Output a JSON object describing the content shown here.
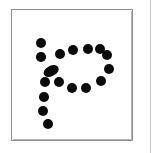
{
  "canvas": {
    "width": 154,
    "height": 153,
    "background_color": "#ffffff"
  },
  "frame": {
    "label": "stimulus-card",
    "x": 11,
    "y": 9,
    "width": 122,
    "height": 132,
    "border_color": "#8f8f8f",
    "border_width": 1,
    "fill_color": "#ffffff"
  },
  "outer_panel_edge": {
    "label": "panel-edge-right",
    "x": 150,
    "color": "#c9c9c9"
  },
  "glyph": {
    "label": "dotted-letter-p",
    "description": "Lowercase letter p drawn as a sequence of discrete filled black dots",
    "character": "p",
    "dot_color": "#0a0a0a",
    "dot_count": 19,
    "stroke_parts": [
      "bowl",
      "stem"
    ]
  },
  "chart_data": {
    "type": "scatter",
    "xlabel": "",
    "ylabel": "",
    "xlim": [
      11,
      133
    ],
    "ylim": [
      9,
      141
    ],
    "grid": false,
    "legend": null,
    "marker": "circle",
    "marker_color": "#0a0a0a",
    "series": [
      {
        "name": "bowl",
        "points": [
          {
            "x": 40,
            "y": 42,
            "r": 5.0
          },
          {
            "x": 40,
            "y": 56,
            "r": 4.8
          },
          {
            "x": 50,
            "y": 70,
            "r": 5.6,
            "elongated": true,
            "angle": 62
          },
          {
            "x": 44,
            "y": 81,
            "r": 5.0
          },
          {
            "x": 58,
            "y": 81,
            "r": 5.0
          },
          {
            "x": 59,
            "y": 53,
            "r": 5.0
          },
          {
            "x": 72,
            "y": 49,
            "r": 5.2
          },
          {
            "x": 87,
            "y": 48,
            "r": 5.2
          },
          {
            "x": 99,
            "y": 48,
            "r": 5.0
          },
          {
            "x": 106,
            "y": 54,
            "r": 5.2
          },
          {
            "x": 108,
            "y": 68,
            "r": 5.0
          },
          {
            "x": 100,
            "y": 80,
            "r": 5.0
          },
          {
            "x": 85,
            "y": 87,
            "r": 5.0
          },
          {
            "x": 71,
            "y": 87,
            "r": 5.2
          }
        ]
      },
      {
        "name": "stem",
        "points": [
          {
            "x": 43,
            "y": 96,
            "r": 4.8
          },
          {
            "x": 42,
            "y": 110,
            "r": 5.0
          },
          {
            "x": 47,
            "y": 123,
            "r": 5.0
          }
        ]
      }
    ]
  }
}
